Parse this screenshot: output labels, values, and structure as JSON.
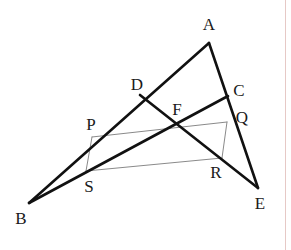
{
  "figure": {
    "width": 291,
    "height": 250,
    "background_color": "#ffffff",
    "thick_stroke_color": "#111111",
    "thick_stroke_width": 2.6,
    "thin_stroke_color": "#8a8a8a",
    "thin_stroke_width": 1.0,
    "label_color": "#1a1a1a",
    "right_margin_rule_color": "#e6c9c6"
  },
  "points": [
    {
      "id": "A",
      "label": "A",
      "x": 209,
      "y": 43,
      "label_x": 209,
      "label_y": 24
    },
    {
      "id": "B",
      "label": "B",
      "x": 29,
      "y": 203,
      "label_x": 21,
      "label_y": 218
    },
    {
      "id": "C",
      "label": "C",
      "x": 228,
      "y": 96,
      "label_x": 239,
      "label_y": 90
    },
    {
      "id": "D",
      "label": "D",
      "x": 140,
      "y": 95,
      "label_x": 137,
      "label_y": 84
    },
    {
      "id": "E",
      "label": "E",
      "x": 258,
      "y": 188,
      "label_x": 260,
      "label_y": 203
    },
    {
      "id": "F",
      "label": "F",
      "x": 178,
      "y": 126,
      "label_x": 177,
      "label_y": 109
    },
    {
      "id": "P",
      "label": "P",
      "x": 92,
      "y": 137,
      "label_x": 91,
      "label_y": 124
    },
    {
      "id": "Q",
      "label": "Q",
      "x": 227,
      "y": 122,
      "label_x": 242,
      "label_y": 117
    },
    {
      "id": "R",
      "label": "R",
      "x": 222,
      "y": 158,
      "label_x": 216,
      "label_y": 172
    },
    {
      "id": "S",
      "label": "S",
      "x": 86,
      "y": 171,
      "label_x": 89,
      "label_y": 186
    }
  ],
  "segments": [
    {
      "id": "AB",
      "from": "A",
      "to": "B",
      "weight": "thick"
    },
    {
      "id": "AE",
      "from": "A",
      "to": "E",
      "weight": "thick"
    },
    {
      "id": "BC",
      "from": "B",
      "to": "C",
      "weight": "thick"
    },
    {
      "id": "DE",
      "from": "D",
      "to": "E",
      "weight": "thick"
    },
    {
      "id": "PQ",
      "from": "P",
      "to": "Q",
      "weight": "thin"
    },
    {
      "id": "QR",
      "from": "Q",
      "to": "R",
      "weight": "thin"
    },
    {
      "id": "RS",
      "from": "R",
      "to": "S",
      "weight": "thin"
    },
    {
      "id": "SP",
      "from": "S",
      "to": "P",
      "weight": "thin"
    }
  ]
}
